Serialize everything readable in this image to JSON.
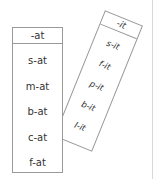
{
  "cards": {
    "left": {
      "header": "-at",
      "words": [
        "s-at",
        "m-at",
        "b-at",
        "c-at",
        "f-at"
      ]
    },
    "right": {
      "header": "-it",
      "words": [
        "s-it",
        "f-it",
        "p-it",
        "b-it",
        "l-it"
      ]
    }
  },
  "colors": {
    "border": "#9a9a9a",
    "text": "#333333",
    "divider": "#d8d8d8"
  }
}
